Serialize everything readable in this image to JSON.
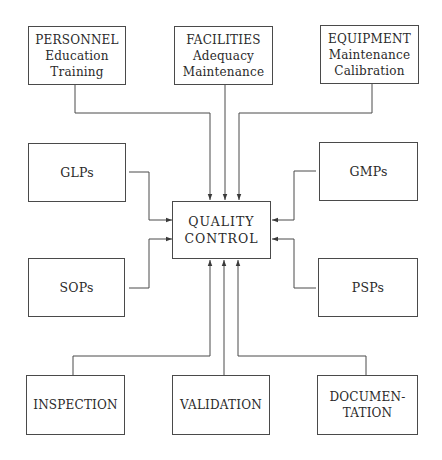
{
  "diagram": {
    "center": {
      "id": "quality-control",
      "lines": [
        "QUALITY",
        "CONTROL"
      ]
    },
    "inputs": [
      {
        "id": "personnel",
        "position": "top-left",
        "lines": [
          "PERSONNEL",
          "Education",
          "Training"
        ]
      },
      {
        "id": "facilities",
        "position": "top-center",
        "lines": [
          "FACILITIES",
          "Adequacy",
          "Maintenance"
        ]
      },
      {
        "id": "equipment",
        "position": "top-right",
        "lines": [
          "EQUIPMENT",
          "Maintenance",
          "Calibration"
        ]
      },
      {
        "id": "glps",
        "position": "middle-left-upper",
        "lines": [
          "GLPs"
        ]
      },
      {
        "id": "sops",
        "position": "middle-left-lower",
        "lines": [
          "SOPs"
        ]
      },
      {
        "id": "gmps",
        "position": "middle-right-upper",
        "lines": [
          "GMPs"
        ]
      },
      {
        "id": "psps",
        "position": "middle-right-lower",
        "lines": [
          "PSPs"
        ]
      },
      {
        "id": "inspection",
        "position": "bottom-left",
        "lines": [
          "INSPECTION"
        ]
      },
      {
        "id": "validation",
        "position": "bottom-center",
        "lines": [
          "VALIDATION"
        ]
      },
      {
        "id": "documentation",
        "position": "bottom-right",
        "lines": [
          "DOCUMEN-",
          "TATION"
        ]
      }
    ],
    "edges": [
      {
        "from": "personnel",
        "to": "quality-control"
      },
      {
        "from": "facilities",
        "to": "quality-control"
      },
      {
        "from": "equipment",
        "to": "quality-control"
      },
      {
        "from": "glps",
        "to": "quality-control"
      },
      {
        "from": "sops",
        "to": "quality-control"
      },
      {
        "from": "gmps",
        "to": "quality-control"
      },
      {
        "from": "psps",
        "to": "quality-control"
      },
      {
        "from": "inspection",
        "to": "quality-control"
      },
      {
        "from": "validation",
        "to": "quality-control"
      },
      {
        "from": "documentation",
        "to": "quality-control"
      }
    ],
    "colors": {
      "line": "#4a4a4a",
      "text": "#2a2a2a",
      "background": "#ffffff"
    }
  }
}
